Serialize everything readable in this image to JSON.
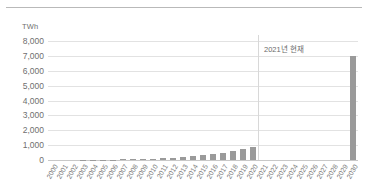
{
  "chart_data": {
    "type": "bar",
    "title": "",
    "subtitle": "",
    "xlabel": "",
    "ylabel": "TWh",
    "unit_label": "TWh",
    "ylim": [
      0,
      8000
    ],
    "ytick_labels": [
      "8,000",
      "7,000",
      "6,000",
      "5,000",
      "4,000",
      "3,000",
      "2,000",
      "1,000",
      "0"
    ],
    "ytick_values": [
      8000,
      7000,
      6000,
      5000,
      4000,
      3000,
      2000,
      1000,
      0
    ],
    "grid": true,
    "legend": "none",
    "bar_color": "#9a9a9a",
    "gridline_color": "#e2e2e2",
    "axis_color": "#c8c8c8",
    "categories": [
      "2000",
      "2001",
      "2002",
      "2003",
      "2004",
      "2005",
      "2006",
      "2007",
      "2008",
      "2009",
      "2010",
      "2011",
      "2012",
      "2013",
      "2014",
      "2015",
      "2016",
      "2017",
      "2018",
      "2019",
      "2020",
      "2021",
      "2022",
      "2023",
      "2024",
      "2025",
      "2026",
      "2027",
      "2028",
      "2029",
      "2030"
    ],
    "values": [
      2,
      3,
      5,
      8,
      12,
      18,
      25,
      35,
      48,
      62,
      80,
      105,
      140,
      185,
      240,
      310,
      400,
      500,
      630,
      720,
      850,
      0,
      0,
      0,
      0,
      0,
      0,
      0,
      0,
      0,
      7000
    ],
    "annotations": [
      {
        "text": "2021년 현재",
        "at_category": "2021",
        "type": "vertical-divider-with-label"
      }
    ]
  }
}
